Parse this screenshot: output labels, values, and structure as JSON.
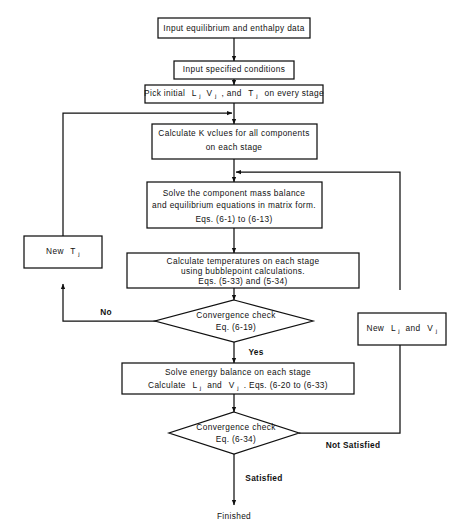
{
  "diagram": {
    "colors": {
      "line": "#101010",
      "text": "#111111",
      "background": "#ffffff"
    },
    "nodes": {
      "input_data": {
        "label": "Input  equilibrium  and  enthalpy  data"
      },
      "input_conditions": {
        "label": "Input  specified  conditions"
      },
      "pick_initial": {
        "part1": "Pick  initial",
        "var1": "L",
        "sub1": "j",
        "var2": "V",
        "sub2": "j",
        "part2": ", and",
        "var3": "T",
        "sub3": "j",
        "part3": "on  every  stage"
      },
      "calc_k": {
        "line1": "Calculate  K  vclues  for  all  components",
        "line2": "on  each  stage"
      },
      "solve_mass": {
        "line1": "Solve  the  component  mass  balance",
        "line2": "and  equilibrium  equations  in  matrix   form.",
        "line3": "Eqs. (6-1)  to  (6-13)"
      },
      "calc_temps": {
        "line1": "Calculate   temperatures  on each  stage",
        "line2": "using  bubblepoint  calculations.",
        "line3": "Eqs. (5-33) and (5-34)"
      },
      "new_tj": {
        "prefix": "New",
        "var": "T",
        "sub": "j"
      },
      "new_lj_vj": {
        "prefix": "New",
        "var1": "L",
        "sub1": "j",
        "mid": "and",
        "var2": "V",
        "sub2": "j"
      },
      "convergence_1": {
        "line1": "Convergence  check",
        "line2": "Eq. (6-19)"
      },
      "solve_energy": {
        "line1": "Solve  energy  balance  on  each  stage",
        "line2a": "Calculate",
        "var1": "L",
        "sub1": "j",
        "mid": "and",
        "var2": "V",
        "sub2": "j",
        "line2b": ".    Eqs. (6-20 to (6-33)"
      },
      "convergence_2": {
        "line1": "Convergence  check",
        "line2": "Eq. (6-34)"
      },
      "finished": {
        "label": "Finished"
      }
    },
    "edge_labels": {
      "no": "No",
      "yes": "Yes",
      "satisfied": "Satisfied",
      "not_satisfied": "Not  Satisfied"
    }
  }
}
